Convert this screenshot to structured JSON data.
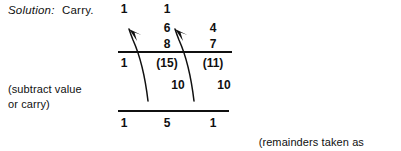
{
  "document": {
    "solution": {
      "label": "Solution:",
      "value": "Carry."
    },
    "side_note": "(subtract value\nor carry)",
    "foot_note": {
      "line1": "(remainders taken as",
      "line2": "decimal sum)"
    },
    "computation": {
      "carry_row": [
        "1",
        "1",
        ""
      ],
      "top_row": [
        "",
        "6",
        "4"
      ],
      "bottom_row": [
        "",
        "8",
        "7"
      ],
      "remainder_row": [
        "1",
        "(15)",
        "(11)"
      ],
      "subtract_row": [
        "",
        "10",
        "10"
      ],
      "sum_row": [
        "1",
        "5",
        "1"
      ],
      "rules": [
        "horizontal-rule-upper",
        "horizontal-rule-lower"
      ],
      "arrows": [
        "carry-arrow-left",
        "carry-arrow-right"
      ]
    }
  },
  "colors": {
    "ink": "#101010",
    "page": "#ffffff"
  }
}
